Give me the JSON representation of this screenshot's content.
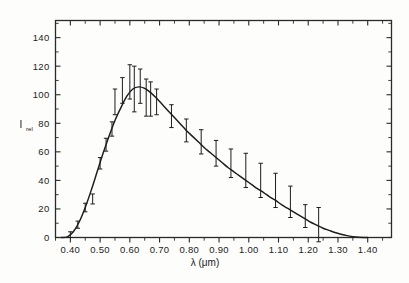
{
  "figure": {
    "background_color": "#fdfdfc",
    "ink_color": "#1c1c1c",
    "frame_color": "#2a2a2a"
  },
  "axes": {
    "y_axis_title_main": "I",
    "y_axis_title_sub": "rel",
    "x_axis_title": "λ (μm)",
    "x_tick_labels": [
      "0.40",
      "0.50",
      "0.60",
      "0.70",
      "0.80",
      "0.90",
      "1.00",
      "1.10",
      "1.20",
      "1.30",
      "1.40"
    ],
    "y_tick_labels": [
      "0",
      "20",
      "40",
      "60",
      "80",
      "100",
      "120",
      "140"
    ]
  },
  "chart_data": {
    "type": "line",
    "title": "",
    "subtitle": "",
    "xlabel": "λ (μm)",
    "ylabel": "I_rel",
    "xlim": [
      0.35,
      1.48
    ],
    "ylim": [
      0,
      152
    ],
    "grid": false,
    "legend": null,
    "x_ticks": [
      0.4,
      0.5,
      0.6,
      0.7,
      0.8,
      0.9,
      1.0,
      1.1,
      1.2,
      1.3,
      1.4
    ],
    "y_ticks": [
      0,
      20,
      40,
      60,
      80,
      100,
      120,
      140
    ],
    "x_minor_tick_step": 0.05,
    "y_minor_tick_step": 10,
    "tick_direction": "in",
    "series": [
      {
        "name": "fitted spectral curve",
        "type": "line",
        "x": [
          0.37,
          0.39,
          0.41,
          0.43,
          0.45,
          0.47,
          0.49,
          0.51,
          0.53,
          0.55,
          0.57,
          0.59,
          0.61,
          0.63,
          0.65,
          0.67,
          0.69,
          0.71,
          0.73,
          0.75,
          0.77,
          0.79,
          0.81,
          0.83,
          0.85,
          0.87,
          0.89,
          0.91,
          0.93,
          0.95,
          0.97,
          0.99,
          1.01,
          1.03,
          1.05,
          1.07,
          1.09,
          1.11,
          1.13,
          1.15,
          1.17,
          1.19,
          1.21,
          1.23,
          1.25,
          1.27,
          1.29,
          1.31,
          1.33,
          1.35,
          1.37,
          1.385,
          1.4
        ],
        "y": [
          0.0,
          0.5,
          4.0,
          11.0,
          21.0,
          33.0,
          46.0,
          59.0,
          71.0,
          82.0,
          91.0,
          99.0,
          104.0,
          105.5,
          104.5,
          101.5,
          97.5,
          93.0,
          88.5,
          84.0,
          79.5,
          75.0,
          71.0,
          67.0,
          63.0,
          59.5,
          56.0,
          52.5,
          49.0,
          46.0,
          43.0,
          40.0,
          37.0,
          34.0,
          31.5,
          28.5,
          26.0,
          23.0,
          20.5,
          18.0,
          15.5,
          13.0,
          10.5,
          8.5,
          6.5,
          5.0,
          3.5,
          2.3,
          1.3,
          0.6,
          0.15,
          0.0,
          0.0
        ]
      }
    ],
    "error_bars": [
      {
        "x": 0.4,
        "y": 2.0,
        "err": 2.0
      },
      {
        "x": 0.425,
        "y": 9.0,
        "err": 2.5
      },
      {
        "x": 0.45,
        "y": 21.0,
        "err": 3.0
      },
      {
        "x": 0.475,
        "y": 27.0,
        "err": 3.5
      },
      {
        "x": 0.5,
        "y": 52.0,
        "err": 4.0
      },
      {
        "x": 0.52,
        "y": 65.0,
        "err": 4.5
      },
      {
        "x": 0.54,
        "y": 76.0,
        "err": 5.0
      },
      {
        "x": 0.55,
        "y": 95.0,
        "err": 9.0
      },
      {
        "x": 0.575,
        "y": 103.0,
        "err": 9.0
      },
      {
        "x": 0.6,
        "y": 109.0,
        "err": 12.0
      },
      {
        "x": 0.615,
        "y": 104.0,
        "err": 16.0
      },
      {
        "x": 0.635,
        "y": 106.0,
        "err": 12.0
      },
      {
        "x": 0.655,
        "y": 98.0,
        "err": 13.0
      },
      {
        "x": 0.67,
        "y": 97.0,
        "err": 12.0
      },
      {
        "x": 0.69,
        "y": 95.0,
        "err": 9.0
      },
      {
        "x": 0.74,
        "y": 85.0,
        "err": 8.0
      },
      {
        "x": 0.79,
        "y": 75.0,
        "err": 8.0
      },
      {
        "x": 0.84,
        "y": 67.0,
        "err": 8.5
      },
      {
        "x": 0.89,
        "y": 59.0,
        "err": 9.0
      },
      {
        "x": 0.94,
        "y": 52.0,
        "err": 10.0
      },
      {
        "x": 0.99,
        "y": 47.0,
        "err": 12.0
      },
      {
        "x": 1.04,
        "y": 40.0,
        "err": 12.0
      },
      {
        "x": 1.09,
        "y": 33.0,
        "err": 12.0
      },
      {
        "x": 1.14,
        "y": 25.0,
        "err": 11.0
      },
      {
        "x": 1.19,
        "y": 15.0,
        "err": 8.0
      },
      {
        "x": 1.235,
        "y": 9.0,
        "err": 12.0
      }
    ]
  }
}
